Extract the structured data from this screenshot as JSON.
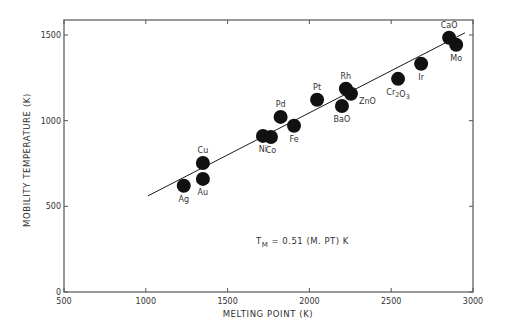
{
  "chart_data": {
    "type": "scatter",
    "title": "",
    "xlabel": "MELTING POINT (K)",
    "ylabel": "MOBILITY TEMPERATURE (K)",
    "xlim": [
      500,
      3000
    ],
    "ylim": [
      0,
      1600
    ],
    "x_ticks": [
      500,
      1000,
      1500,
      2000,
      2500,
      3000
    ],
    "y_ticks": [
      0,
      500,
      1000,
      1500
    ],
    "grid": false,
    "legend": null,
    "annotation": {
      "text_main": "T",
      "text_sub": "M",
      "text_rest": " = 0.51 (M. PT) K"
    },
    "fit_line": {
      "label": "T_M = 0.51 (M. PT) K",
      "x": [
        1013,
        2951
      ],
      "y": [
        561,
        1513
      ]
    },
    "points": [
      {
        "label": "Ag",
        "x": 1232,
        "y": 620,
        "label_pos": "below"
      },
      {
        "label": "Cu",
        "x": 1349,
        "y": 753,
        "label_pos": "above"
      },
      {
        "label": "Au",
        "x": 1349,
        "y": 660,
        "label_pos": "below"
      },
      {
        "label": "Ni",
        "x": 1716,
        "y": 911,
        "label_pos": "below"
      },
      {
        "label": "Co",
        "x": 1765,
        "y": 905,
        "label_pos": "below"
      },
      {
        "label": "Pd",
        "x": 1824,
        "y": 1022,
        "label_pos": "above"
      },
      {
        "label": "Fe",
        "x": 1906,
        "y": 970,
        "label_pos": "below"
      },
      {
        "label": "Pt",
        "x": 2047,
        "y": 1122,
        "label_pos": "above"
      },
      {
        "label": "Rh",
        "x": 2223,
        "y": 1186,
        "label_pos": "above"
      },
      {
        "label": "ZnO",
        "x": 2254,
        "y": 1157,
        "label_pos": "right"
      },
      {
        "label": "BaO",
        "x": 2199,
        "y": 1086,
        "label_pos": "below"
      },
      {
        "label": "Cr2O3",
        "x": 2542,
        "y": 1244,
        "label_pos": "below"
      },
      {
        "label": "Ir",
        "x": 2683,
        "y": 1332,
        "label_pos": "below"
      },
      {
        "label": "CaO",
        "x": 2854,
        "y": 1484,
        "label_pos": "above"
      },
      {
        "label": "Mo",
        "x": 2897,
        "y": 1443,
        "label_pos": "below"
      }
    ]
  },
  "style": {
    "ink": "#1a1a1a",
    "axis": "#555555",
    "background": "#ffffff"
  }
}
